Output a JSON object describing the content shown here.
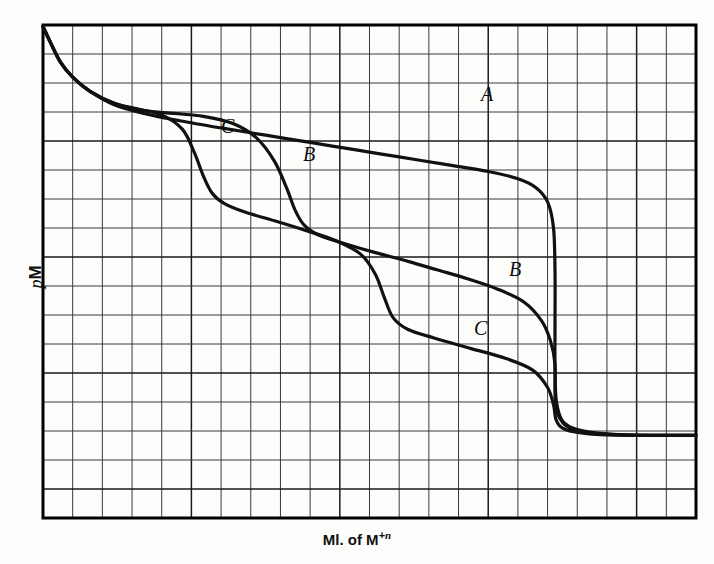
{
  "figure": {
    "axes": {
      "ylabel_italic": "p",
      "ylabel_roman": "M",
      "xlabel_main": "Ml. of M",
      "xlabel_sup_sign": "+",
      "xlabel_sup_n": "n"
    },
    "labels": [
      {
        "name": "curve-label-a-upper",
        "text": "A",
        "x": 481,
        "y": 84
      },
      {
        "name": "curve-label-c-upper",
        "text": "C",
        "x": 221,
        "y": 116
      },
      {
        "name": "curve-label-b-upper",
        "text": "B",
        "x": 303,
        "y": 144
      },
      {
        "name": "curve-label-b-lower",
        "text": "B",
        "x": 509,
        "y": 259
      },
      {
        "name": "curve-label-c-lower",
        "text": "C",
        "x": 474,
        "y": 318
      }
    ],
    "colors": {
      "ink": "#111111",
      "grid_minor": "#3a3a3a",
      "grid_major": "#1a1a1a",
      "frame": "#000000",
      "paper": "#fdfdfb"
    }
  },
  "chart_data": {
    "type": "line",
    "title": "",
    "subtitle": "",
    "xlabel": "Ml. of M+n",
    "ylabel": "pM",
    "grid": true,
    "grid_columns": 22,
    "grid_rows": 17,
    "axis_ticks_shown": false,
    "legend": "inline-curve-labels",
    "legend_position": "inline",
    "xlim": [
      0,
      22
    ],
    "ylim": [
      0,
      17
    ],
    "plot_box_px": {
      "left": 43,
      "top": 25,
      "right": 696,
      "bottom": 518
    },
    "equivalence_point_x": 17.2,
    "series": [
      {
        "name": "A",
        "label_positions": [
          "upper-right before equivalence"
        ],
        "points": [
          [
            0.0,
            16.95
          ],
          [
            0.25,
            16.4
          ],
          [
            0.6,
            15.7
          ],
          [
            1.0,
            15.2
          ],
          [
            1.6,
            14.7
          ],
          [
            2.4,
            14.25
          ],
          [
            3.4,
            13.95
          ],
          [
            4.6,
            13.7
          ],
          [
            6.0,
            13.45
          ],
          [
            7.5,
            13.2
          ],
          [
            9.0,
            12.95
          ],
          [
            10.5,
            12.7
          ],
          [
            12.0,
            12.45
          ],
          [
            13.5,
            12.2
          ],
          [
            15.0,
            11.95
          ],
          [
            16.0,
            11.7
          ],
          [
            16.6,
            11.4
          ],
          [
            17.0,
            10.9
          ],
          [
            17.2,
            10.0
          ],
          [
            17.25,
            8.5
          ],
          [
            17.25,
            6.6
          ],
          [
            17.25,
            5.0
          ],
          [
            17.3,
            4.0
          ],
          [
            17.5,
            3.35
          ],
          [
            18.0,
            3.05
          ],
          [
            19.0,
            2.9
          ],
          [
            20.5,
            2.85
          ],
          [
            22.0,
            2.85
          ]
        ]
      },
      {
        "name": "B",
        "label_positions": [
          "upper-middle first break",
          "lower-right after first break"
        ],
        "points": [
          [
            0.0,
            16.95
          ],
          [
            0.25,
            16.4
          ],
          [
            0.6,
            15.7
          ],
          [
            1.0,
            15.2
          ],
          [
            1.6,
            14.7
          ],
          [
            2.4,
            14.3
          ],
          [
            3.4,
            14.05
          ],
          [
            4.4,
            13.95
          ],
          [
            5.4,
            13.85
          ],
          [
            6.4,
            13.6
          ],
          [
            7.2,
            13.1
          ],
          [
            7.8,
            12.3
          ],
          [
            8.2,
            11.4
          ],
          [
            8.5,
            10.6
          ],
          [
            8.8,
            10.1
          ],
          [
            9.3,
            9.75
          ],
          [
            10.2,
            9.45
          ],
          [
            11.2,
            9.15
          ],
          [
            12.3,
            8.85
          ],
          [
            13.3,
            8.55
          ],
          [
            14.3,
            8.25
          ],
          [
            15.3,
            7.9
          ],
          [
            16.2,
            7.45
          ],
          [
            16.8,
            6.8
          ],
          [
            17.1,
            6.1
          ],
          [
            17.25,
            5.3
          ],
          [
            17.25,
            4.3
          ],
          [
            17.3,
            3.7
          ],
          [
            17.6,
            3.2
          ],
          [
            18.2,
            2.95
          ],
          [
            19.4,
            2.87
          ],
          [
            21.0,
            2.85
          ],
          [
            22.0,
            2.85
          ]
        ]
      },
      {
        "name": "C",
        "label_positions": [
          "upper-left first break",
          "lower-middle second break"
        ],
        "points": [
          [
            0.0,
            16.95
          ],
          [
            0.25,
            16.4
          ],
          [
            0.6,
            15.7
          ],
          [
            1.0,
            15.2
          ],
          [
            1.6,
            14.7
          ],
          [
            2.4,
            14.3
          ],
          [
            3.2,
            14.1
          ],
          [
            4.0,
            13.9
          ],
          [
            4.7,
            13.4
          ],
          [
            5.1,
            12.6
          ],
          [
            5.4,
            11.8
          ],
          [
            5.7,
            11.2
          ],
          [
            6.1,
            10.85
          ],
          [
            6.8,
            10.55
          ],
          [
            7.8,
            10.25
          ],
          [
            8.9,
            9.9
          ],
          [
            9.9,
            9.55
          ],
          [
            10.7,
            9.1
          ],
          [
            11.2,
            8.4
          ],
          [
            11.5,
            7.6
          ],
          [
            11.8,
            6.9
          ],
          [
            12.3,
            6.5
          ],
          [
            13.2,
            6.2
          ],
          [
            14.4,
            5.85
          ],
          [
            15.6,
            5.5
          ],
          [
            16.5,
            5.1
          ],
          [
            17.0,
            4.5
          ],
          [
            17.2,
            3.9
          ],
          [
            17.3,
            3.35
          ],
          [
            17.6,
            3.05
          ],
          [
            18.4,
            2.9
          ],
          [
            19.8,
            2.85
          ],
          [
            22.0,
            2.85
          ]
        ]
      }
    ]
  }
}
